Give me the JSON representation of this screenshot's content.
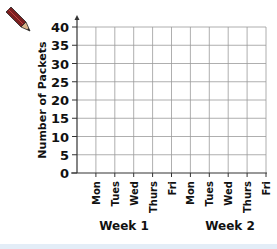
{
  "chart_data": {
    "type": "bar",
    "title": "",
    "xlabel": "",
    "ylabel": "Number of Packets",
    "ylim": [
      0,
      40
    ],
    "y_ticks": [
      0,
      5,
      10,
      15,
      20,
      25,
      30,
      35,
      40
    ],
    "categories": [
      "Mon",
      "Tues",
      "Wed",
      "Thurs",
      "Fri",
      "Mon",
      "Tues",
      "Wed",
      "Thurs",
      "Fri"
    ],
    "groups": [
      {
        "label": "Week 1",
        "categories": [
          "Mon",
          "Tues",
          "Wed",
          "Thurs",
          "Fri"
        ]
      },
      {
        "label": "Week 2",
        "categories": [
          "Mon",
          "Tues",
          "Wed",
          "Thurs",
          "Fri"
        ]
      }
    ],
    "series": [],
    "grid": true,
    "legend": "none",
    "note": "Blank graph grid with no plotted data"
  },
  "labels": {
    "ylabel": "Number of Packets",
    "week1": "Week 1",
    "week2": "Week 2"
  },
  "colors": {
    "grid": "#9a9a9a",
    "axis": "#333333",
    "text": "#111111",
    "pencil_body": "#7a1f1f",
    "pencil_tip": "#d9b48a"
  }
}
